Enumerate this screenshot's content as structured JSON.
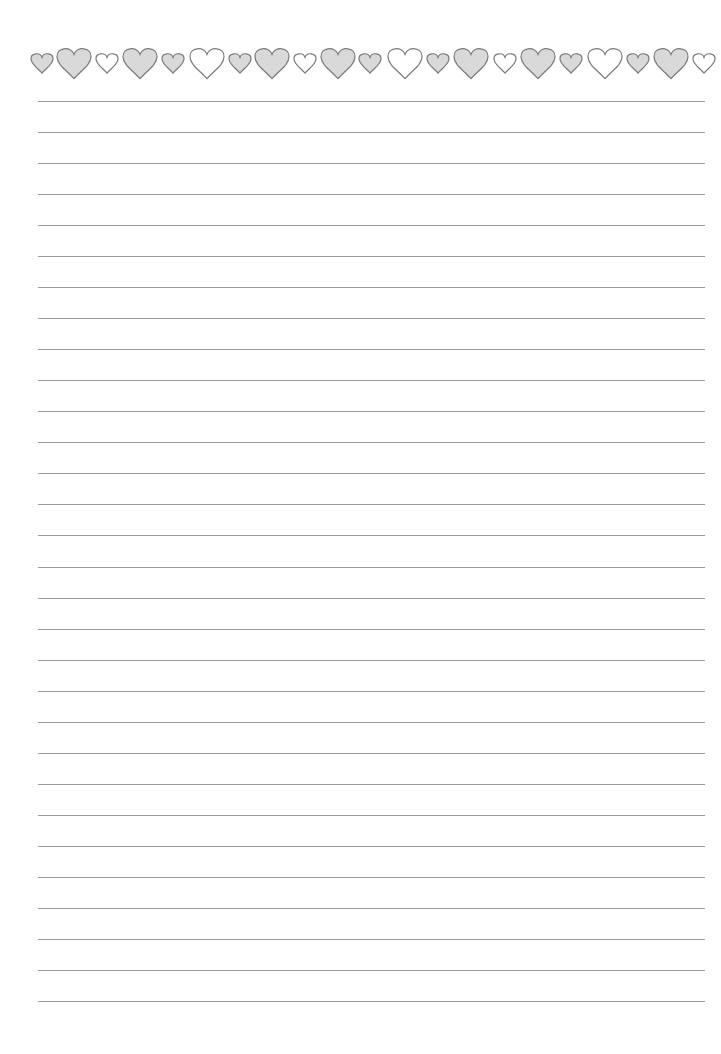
{
  "page": {
    "type": "lined stationery",
    "background": "#ffffff",
    "line_color": "#9a9a9a",
    "line_count": 30,
    "line_left": 38,
    "line_right": 705,
    "first_line_y": 101,
    "last_line_y": 1001
  },
  "border": {
    "center_y": 63,
    "stroke": "#7a7a7a",
    "filled_color": "#d9d9d9",
    "hearts": [
      {
        "x": 42,
        "size": "small",
        "filled": true
      },
      {
        "x": 74,
        "size": "large",
        "filled": true
      },
      {
        "x": 107,
        "size": "small",
        "filled": false
      },
      {
        "x": 140,
        "size": "large",
        "filled": true
      },
      {
        "x": 173,
        "size": "small",
        "filled": true
      },
      {
        "x": 207,
        "size": "large",
        "filled": false
      },
      {
        "x": 240,
        "size": "small",
        "filled": true
      },
      {
        "x": 272,
        "size": "large",
        "filled": true
      },
      {
        "x": 305,
        "size": "small",
        "filled": false
      },
      {
        "x": 338,
        "size": "large",
        "filled": true
      },
      {
        "x": 370,
        "size": "small",
        "filled": true
      },
      {
        "x": 405,
        "size": "large",
        "filled": false
      },
      {
        "x": 438,
        "size": "small",
        "filled": true
      },
      {
        "x": 471,
        "size": "large",
        "filled": true
      },
      {
        "x": 505,
        "size": "small",
        "filled": false
      },
      {
        "x": 538,
        "size": "large",
        "filled": true
      },
      {
        "x": 571,
        "size": "small",
        "filled": true
      },
      {
        "x": 605,
        "size": "large",
        "filled": false
      },
      {
        "x": 638,
        "size": "small",
        "filled": true
      },
      {
        "x": 671,
        "size": "large",
        "filled": true
      },
      {
        "x": 704,
        "size": "small",
        "filled": false
      }
    ]
  }
}
